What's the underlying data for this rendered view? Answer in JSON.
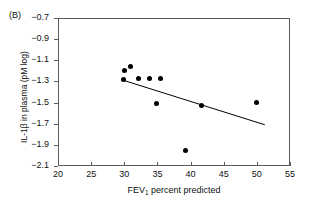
{
  "figure": {
    "panel_label": "(B)"
  },
  "chart_data": {
    "type": "scatter",
    "title": "",
    "xlabel": "FEV1 percent predicted",
    "xlabel_base": "FEV",
    "xlabel_sub": "1",
    "xlabel_rest": " percent predicted",
    "ylabel": "IL-1β in plasma (pM log)",
    "xlim": [
      20,
      55
    ],
    "ylim": [
      -2.1,
      -0.7
    ],
    "xticks": [
      20,
      25,
      30,
      35,
      40,
      45,
      50,
      55
    ],
    "xtick_labels": [
      "20",
      "25",
      "30",
      "35",
      "40",
      "45",
      "50",
      "55"
    ],
    "yticks": [
      -0.7,
      -0.9,
      -1.1,
      -1.3,
      -1.5,
      -1.7,
      -1.9,
      -2.1
    ],
    "ytick_labels": [
      "−0.7",
      "−0.9",
      "−1.1",
      "−1.3",
      "−1.5",
      "−1.7",
      "−1.9",
      "−2.1"
    ],
    "grid": false,
    "legend": false,
    "marker_color": "#000000",
    "marker_shape": "circle",
    "axis_color": "#5b5b5b",
    "points": [
      {
        "x": 29.9,
        "y": -1.28
      },
      {
        "x": 30.0,
        "y": -1.2
      },
      {
        "x": 31.0,
        "y": -1.16
      },
      {
        "x": 32.1,
        "y": -1.27
      },
      {
        "x": 33.8,
        "y": -1.27
      },
      {
        "x": 35.4,
        "y": -1.27
      },
      {
        "x": 34.8,
        "y": -1.51
      },
      {
        "x": 41.7,
        "y": -1.53
      },
      {
        "x": 39.3,
        "y": -1.95
      },
      {
        "x": 49.9,
        "y": -1.5
      }
    ],
    "trendline": {
      "type": "linear-fit",
      "x_start": 29.9,
      "y_start": -1.29,
      "x_end": 51.2,
      "y_end": -1.71,
      "color": "#000000"
    }
  }
}
